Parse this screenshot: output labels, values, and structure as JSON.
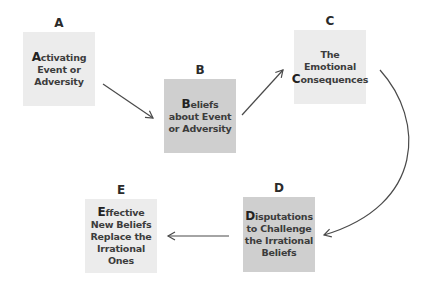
{
  "diagram": {
    "nodes": [
      {
        "id": "A",
        "label": "A",
        "lines": [
          {
            "cap": "A",
            "rest": "ctivating"
          },
          {
            "cap": "",
            "rest": "Event or"
          },
          {
            "cap": "",
            "rest": "Adversity"
          }
        ],
        "fill": "#ececec"
      },
      {
        "id": "B",
        "label": "B",
        "lines": [
          {
            "cap": "B",
            "rest": "eliefs"
          },
          {
            "cap": "",
            "rest": "about Event"
          },
          {
            "cap": "",
            "rest": "or Adversity"
          }
        ],
        "fill": "#cfcfcf"
      },
      {
        "id": "C",
        "label": "C",
        "lines": [
          {
            "cap": "",
            "rest": "The"
          },
          {
            "cap": "",
            "rest": "Emotional"
          },
          {
            "cap": "C",
            "rest": "onsequences"
          }
        ],
        "fill": "#ececec"
      },
      {
        "id": "D",
        "label": "D",
        "lines": [
          {
            "cap": "D",
            "rest": "isputations"
          },
          {
            "cap": "",
            "rest": "to Challenge"
          },
          {
            "cap": "",
            "rest": "the Irrational"
          },
          {
            "cap": "",
            "rest": "Beliefs"
          }
        ],
        "fill": "#cfcfcf"
      },
      {
        "id": "E",
        "label": "E",
        "lines": [
          {
            "cap": "E",
            "rest": "ffective"
          },
          {
            "cap": "",
            "rest": "New Beliefs"
          },
          {
            "cap": "",
            "rest": "Replace the"
          },
          {
            "cap": "",
            "rest": "Irrational"
          },
          {
            "cap": "",
            "rest": "Ones"
          }
        ],
        "fill": "#ececec"
      }
    ],
    "edges": [
      {
        "from": "A",
        "to": "B"
      },
      {
        "from": "B",
        "to": "C"
      },
      {
        "from": "C",
        "to": "D"
      },
      {
        "from": "D",
        "to": "E"
      }
    ],
    "line_color": "#4a4a4a"
  }
}
